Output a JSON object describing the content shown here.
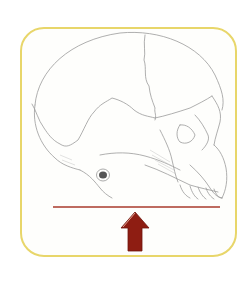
{
  "figure": {
    "frame_color": "#e8d66a",
    "baseline_color": "#a83a2c",
    "arrow_color": "#8e1d12",
    "icons": [
      "skull-illustration",
      "baseline",
      "arrow-up-icon"
    ]
  }
}
